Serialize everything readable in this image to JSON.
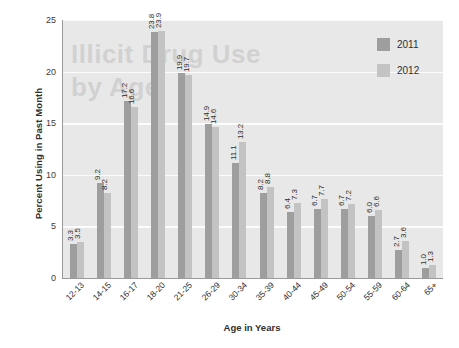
{
  "chart_data": {
    "type": "bar",
    "title": "",
    "xlabel": "Age in Years",
    "ylabel": "Percent Using in Past Month",
    "ylim": [
      0,
      25
    ],
    "yticks": [
      0,
      5,
      10,
      15,
      20,
      25
    ],
    "grid": true,
    "legend_position": "top-right",
    "categories": [
      "12-13",
      "14-15",
      "16-17",
      "18-20",
      "21-25",
      "26-29",
      "30-34",
      "35-39",
      "40-44",
      "45-49",
      "50-54",
      "55-59",
      "60-64",
      "65+"
    ],
    "series": [
      {
        "name": "2011",
        "color": "#9e9e9e",
        "values": [
          3.3,
          9.2,
          17.2,
          23.8,
          19.9,
          14.9,
          11.1,
          8.2,
          6.4,
          6.7,
          6.7,
          6.0,
          2.7,
          1.0
        ],
        "labels": [
          "3.3",
          "9.2",
          "17.2",
          "23.8",
          "19.9",
          "14.9",
          "11.1",
          "8.2",
          "6.4",
          "6.7",
          "6.7",
          "6.0",
          "2.7",
          "1.0"
        ]
      },
      {
        "name": "2012",
        "color": "#c3c3c3",
        "values": [
          3.5,
          8.2,
          16.6,
          23.9,
          19.7,
          14.6,
          13.2,
          8.8,
          7.3,
          7.7,
          7.2,
          6.6,
          3.6,
          1.3
        ],
        "labels": [
          "3.5",
          "8.2",
          "16.6",
          "23.9",
          "19.7",
          "14.6",
          "13.2",
          "8.8",
          "7.3",
          "7.7",
          "7.2",
          "6.6",
          "3.6",
          "1.3"
        ]
      }
    ]
  },
  "legend": {
    "items": [
      {
        "label": "2011",
        "color": "#9e9e9e"
      },
      {
        "label": "2012",
        "color": "#c3c3c3"
      }
    ]
  },
  "axes": {
    "y_title": "Percent Using in Past Month",
    "x_title": "Age in Years"
  },
  "watermark": {
    "text": "Illicit Drug Use\nby Age"
  },
  "colors": {
    "plot_background": "#e8e8e8",
    "gridline": "#fcfcfc",
    "axis_line": "#9a9a9a",
    "series_2011": "#9e9e9e",
    "series_2012": "#c3c3c3",
    "text": "#2e2e2e"
  }
}
